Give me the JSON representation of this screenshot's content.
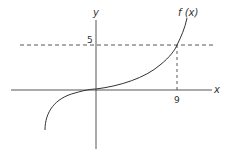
{
  "diagram": {
    "axes": {
      "x_label": "x",
      "y_label": "y"
    },
    "function_label": "f (x)",
    "marked_points": {
      "y_value_label": "5",
      "x_value_label": "9"
    },
    "colors": {
      "line": "#333333",
      "background": "#ffffff"
    }
  }
}
